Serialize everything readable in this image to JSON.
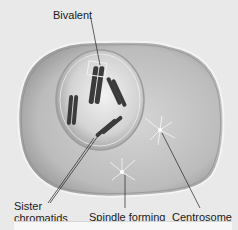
{
  "diagram": {
    "type": "cell illustration (meiosis prophase I)",
    "labels": {
      "bivalent": "Bivalent",
      "sister_chromatids_line1": "Sister",
      "sister_chromatids_line2": "chromatids",
      "spindle_forming": "Spindle forming",
      "centrosome": "Centrosome"
    },
    "colors": {
      "background": "#e9e9e9",
      "cytoplasm": "#bdbdbd",
      "nucleus": "#d9d9d9",
      "chromosome": "#3a3a3a",
      "membrane": "#f4f4f4"
    }
  }
}
